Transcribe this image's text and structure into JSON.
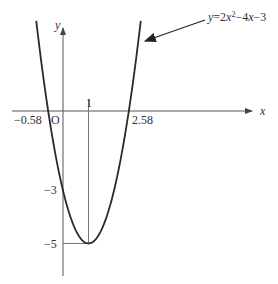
{
  "chart_data": {
    "type": "line",
    "title": "",
    "equation_label": "y=2x²−4x−3",
    "equation_parts": {
      "y": "y",
      "eq": "=2",
      "x1": "x",
      "sup": "2",
      "mid": "−4",
      "x2": "x",
      "tail": "−3"
    },
    "xlabel": "x",
    "ylabel": "y",
    "origin_label": "O",
    "function": {
      "a": 2,
      "b": -4,
      "c": -3
    },
    "x_range": [
      -1.05,
      3.05
    ],
    "ylim": [
      -6.3,
      3.2
    ],
    "annotations": {
      "root_left": {
        "x": -0.58,
        "label": "−0.58"
      },
      "root_right": {
        "x": 2.58,
        "label": "2.58"
      },
      "vertex": {
        "x": 1,
        "y": -5,
        "x_label": "1",
        "y_label": "−5"
      },
      "y_intercept": {
        "x": 0,
        "y": -3,
        "label": "−3"
      }
    },
    "grid": false,
    "colors": {
      "curve": "#2a2a2a",
      "axis": "#555555",
      "guide": "#777777"
    }
  }
}
